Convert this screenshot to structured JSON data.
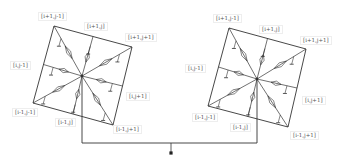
{
  "colors": {
    "stroke": "#333333",
    "label": "#555555",
    "background": "#ffffff"
  },
  "cells": [
    {
      "name": "left",
      "corners": {
        "tl": [
          54,
          26
        ],
        "tr": [
          132,
          47
        ],
        "br": [
          113,
          125
        ],
        "bl": [
          33,
          103
        ]
      },
      "center": [
        82,
        76
      ],
      "labels": [
        {
          "id": "i+1,j-1",
          "text": "[i+1,j-1]",
          "x": 38,
          "y": 12
        },
        {
          "id": "i+1,j",
          "text": "[i+1,j]",
          "x": 84,
          "y": 22
        },
        {
          "id": "i+1,j+1",
          "text": "[i+1,j+1]",
          "x": 125,
          "y": 33
        },
        {
          "id": "i,j-1",
          "text": "[i,j-1]",
          "x": 10,
          "y": 61
        },
        {
          "id": "i,j+1",
          "text": "[i,j+1]",
          "x": 126,
          "y": 92
        },
        {
          "id": "i-1,j-1",
          "text": "[i-1,j-1]",
          "x": 12,
          "y": 108
        },
        {
          "id": "i-1,j",
          "text": "[i-1,j]",
          "x": 55,
          "y": 118
        },
        {
          "id": "i-1,j+1",
          "text": "[i-1,j+1]",
          "x": 113,
          "y": 125
        }
      ]
    },
    {
      "name": "right",
      "corners": {
        "tl": [
          229,
          28
        ],
        "tr": [
          306,
          49
        ],
        "br": [
          288,
          127
        ],
        "bl": [
          208,
          106
        ]
      },
      "center": [
        257,
        79
      ],
      "labels": [
        {
          "id": "i+1,j-1",
          "text": "[i+1,j-1]",
          "x": 213,
          "y": 14
        },
        {
          "id": "i+1,j",
          "text": "[i+1,j]",
          "x": 259,
          "y": 25
        },
        {
          "id": "i+1,j+1",
          "text": "[i+1,j+1]",
          "x": 300,
          "y": 36
        },
        {
          "id": "i,j-1",
          "text": "[i,j-1]",
          "x": 185,
          "y": 64
        },
        {
          "id": "i,j+1",
          "text": "[i,j+1]",
          "x": 302,
          "y": 96
        },
        {
          "id": "i-1,j-1",
          "text": "[i-1,j-1]",
          "x": 192,
          "y": 113
        },
        {
          "id": "i-1,j",
          "text": "[i-1,j]",
          "x": 230,
          "y": 123
        },
        {
          "id": "i-1,j+1",
          "text": "[i-1,j+1]",
          "x": 290,
          "y": 131
        }
      ]
    }
  ],
  "bus": {
    "y": 143,
    "ground": {
      "x": 171,
      "dot_y": 153
    }
  }
}
